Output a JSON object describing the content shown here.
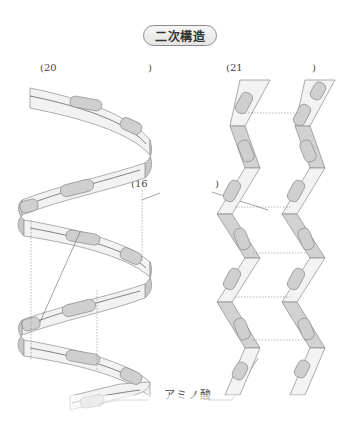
{
  "title": "二次構造",
  "blanks": [
    {
      "id": "20",
      "open": "(20",
      "close": ")"
    },
    {
      "id": "21",
      "open": "(21",
      "close": ")"
    },
    {
      "id": "16",
      "open": "(16",
      "close": ")"
    }
  ],
  "labels": {
    "amino_acid": "アミノ酸"
  },
  "colors": {
    "ribbon_fill": "#f2f2f2",
    "ribbon_edge": "#9a9a9a",
    "residue_fill": "#cfcfcf",
    "residue_stroke": "#8c8c8c",
    "sheet_fill": "#d2d2d2",
    "dotted_line": "#888888"
  }
}
